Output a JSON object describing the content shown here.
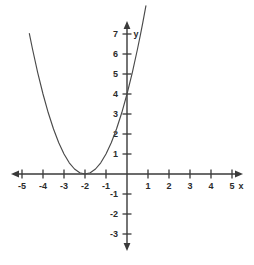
{
  "figure": {
    "background_color": "#ffffff",
    "axis_color": "#3a3a3a",
    "curve_color": "#4a4a4a",
    "label_color": "#2b2b2b",
    "x_axis_label": "x",
    "y_axis_label": "y"
  },
  "chart_data": {
    "type": "line",
    "title": "",
    "xlabel": "x",
    "ylabel": "y",
    "xlim": [
      -5.4,
      5.4
    ],
    "ylim": [
      -3.4,
      7.4
    ],
    "grid": false,
    "legend": "none",
    "x_ticks": [
      -5,
      -4,
      -3,
      -2,
      -1,
      1,
      2,
      3,
      4,
      5
    ],
    "y_ticks": [
      -3,
      -2,
      -1,
      1,
      2,
      3,
      4,
      5,
      6,
      7
    ],
    "x_tick_labels": [
      "-5",
      "-4",
      "-3",
      "-2",
      "-1",
      "1",
      "2",
      "3",
      "4",
      "5"
    ],
    "y_tick_labels": [
      "-3",
      "-2",
      "-1",
      "1",
      "2",
      "3",
      "4",
      "5",
      "6",
      "7"
    ],
    "series": [
      {
        "name": "y = (x + 2)^2",
        "equation": "y = (x + 2)^2",
        "vertex": [
          -2,
          0
        ],
        "y_intercept": [
          0,
          4
        ],
        "x_intercepts": [
          -2
        ],
        "x": [
          -4.65,
          -4.5,
          -4.25,
          -4.0,
          -3.75,
          -3.5,
          -3.25,
          -3.0,
          -2.75,
          -2.5,
          -2.25,
          -2.0,
          -1.75,
          -1.5,
          -1.25,
          -1.0,
          -0.75,
          -0.5,
          -0.25,
          0.0,
          0.25,
          0.5,
          0.65,
          0.75,
          0.9
        ],
        "y": [
          7.02,
          6.25,
          5.06,
          4.0,
          3.06,
          2.25,
          1.56,
          1.0,
          0.56,
          0.25,
          0.06,
          0.0,
          0.06,
          0.25,
          0.56,
          1.0,
          1.56,
          2.25,
          3.06,
          4.0,
          5.06,
          6.25,
          7.02,
          7.56,
          8.41
        ]
      }
    ]
  },
  "axes_geometry": {
    "origin_x": 127,
    "origin_y": 174,
    "unit_x": 21,
    "unit_y": 20
  }
}
